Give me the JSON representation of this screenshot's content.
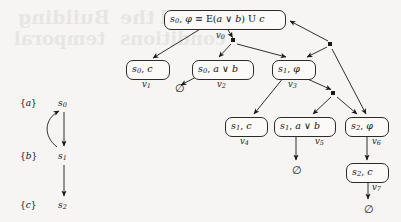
{
  "figure": {
    "kind": "tableau-graph-with-transition-system",
    "background_color": "#f6f5f3",
    "ink_color": "#1a1a1a",
    "node_fill": "#fbfaf8"
  },
  "transition_system": {
    "title": "",
    "states": [
      {
        "id": "s0",
        "state_label": "s",
        "state_sub": "0",
        "ap_label": "{a}",
        "x": 63,
        "y": 103,
        "ap_x": 20,
        "ap_y": 103
      },
      {
        "id": "s1",
        "state_label": "s",
        "state_sub": "1",
        "ap_label": "{b}",
        "x": 63,
        "y": 156,
        "ap_x": 20,
        "ap_y": 156
      },
      {
        "id": "s2",
        "state_label": "s",
        "state_sub": "2",
        "ap_label": "{c}",
        "x": 63,
        "y": 205,
        "ap_x": 20,
        "ap_y": 205
      }
    ],
    "transitions": [
      {
        "from": "s0",
        "to": "s1",
        "style": "straight-down"
      },
      {
        "from": "s1",
        "to": "s0",
        "style": "curved-back-up"
      },
      {
        "from": "s1",
        "to": "s2",
        "style": "straight-down"
      }
    ]
  },
  "tableau": {
    "nodes": [
      {
        "id": "v0",
        "text_parts": [
          {
            "t": "s",
            "style": "italic"
          },
          {
            "t": "0",
            "style": "sub"
          },
          {
            "t": ", ",
            "style": "upright"
          },
          {
            "t": "φ",
            "style": "italic"
          },
          {
            "t": " ≡ ",
            "style": "upright"
          },
          {
            "t": "E",
            "style": "upright"
          },
          {
            "t": "(",
            "style": "upright"
          },
          {
            "t": "a",
            "style": "italic"
          },
          {
            "t": " ∨ ",
            "style": "upright"
          },
          {
            "t": "b",
            "style": "italic"
          },
          {
            "t": ") ",
            "style": "upright"
          },
          {
            "t": "U",
            "style": "upright"
          },
          {
            "t": " ",
            "style": "upright"
          },
          {
            "t": "c",
            "style": "italic"
          }
        ],
        "plain": "s0, φ ≡ E(a ∨ b) U c",
        "vlabel": "v",
        "vsub": "0",
        "x": 164,
        "y": 10,
        "w": 122,
        "h": 17,
        "vlabel_x": 216,
        "vlabel_y": 30
      },
      {
        "id": "v1",
        "plain": "s0, c",
        "text_parts": [
          {
            "t": "s",
            "style": "italic"
          },
          {
            "t": "0",
            "style": "sub"
          },
          {
            "t": ", ",
            "style": "upright"
          },
          {
            "t": "c",
            "style": "italic"
          }
        ],
        "vlabel": "v",
        "vsub": "1",
        "x": 126,
        "y": 60,
        "w": 44,
        "h": 16,
        "vlabel_x": 142,
        "vlabel_y": 79
      },
      {
        "id": "v2",
        "plain": "s0, a ∨ b",
        "text_parts": [
          {
            "t": "s",
            "style": "italic"
          },
          {
            "t": "0",
            "style": "sub"
          },
          {
            "t": ", ",
            "style": "upright"
          },
          {
            "t": "a",
            "style": "italic"
          },
          {
            "t": " ∨ ",
            "style": "upright"
          },
          {
            "t": "b",
            "style": "italic"
          }
        ],
        "vlabel": "v",
        "vsub": "2",
        "x": 192,
        "y": 60,
        "w": 62,
        "h": 16,
        "vlabel_x": 217,
        "vlabel_y": 79
      },
      {
        "id": "v3",
        "plain": "s1, φ",
        "text_parts": [
          {
            "t": "s",
            "style": "italic"
          },
          {
            "t": "1",
            "style": "sub"
          },
          {
            "t": ", ",
            "style": "upright"
          },
          {
            "t": "φ",
            "style": "italic"
          }
        ],
        "vlabel": "v",
        "vsub": "3",
        "x": 272,
        "y": 60,
        "w": 44,
        "h": 16,
        "vlabel_x": 288,
        "vlabel_y": 79
      },
      {
        "id": "v4",
        "plain": "s1, c",
        "text_parts": [
          {
            "t": "s",
            "style": "italic"
          },
          {
            "t": "1",
            "style": "sub"
          },
          {
            "t": ", ",
            "style": "upright"
          },
          {
            "t": "c",
            "style": "italic"
          }
        ],
        "vlabel": "v",
        "vsub": "4",
        "x": 225,
        "y": 117,
        "w": 43,
        "h": 16,
        "vlabel_x": 240,
        "vlabel_y": 136
      },
      {
        "id": "v5",
        "plain": "s1, a ∨ b",
        "text_parts": [
          {
            "t": "s",
            "style": "italic"
          },
          {
            "t": "1",
            "style": "sub"
          },
          {
            "t": ", ",
            "style": "upright"
          },
          {
            "t": "a",
            "style": "italic"
          },
          {
            "t": " ∨ ",
            "style": "upright"
          },
          {
            "t": "b",
            "style": "italic"
          }
        ],
        "vlabel": "v",
        "vsub": "5",
        "x": 274,
        "y": 117,
        "w": 62,
        "h": 16,
        "vlabel_x": 315,
        "vlabel_y": 136
      },
      {
        "id": "v6",
        "plain": "s2, φ",
        "text_parts": [
          {
            "t": "s",
            "style": "italic"
          },
          {
            "t": "2",
            "style": "sub"
          },
          {
            "t": ", ",
            "style": "upright"
          },
          {
            "t": "φ",
            "style": "italic"
          }
        ],
        "vlabel": "v",
        "vsub": "6",
        "x": 345,
        "y": 117,
        "w": 44,
        "h": 16,
        "vlabel_x": 372,
        "vlabel_y": 136
      },
      {
        "id": "v7",
        "plain": "s2, c",
        "text_parts": [
          {
            "t": "s",
            "style": "italic"
          },
          {
            "t": "2",
            "style": "sub"
          },
          {
            "t": ", ",
            "style": "upright"
          },
          {
            "t": "c",
            "style": "italic"
          }
        ],
        "vlabel": "v",
        "vsub": "7",
        "x": 346,
        "y": 163,
        "w": 43,
        "h": 16,
        "vlabel_x": 372,
        "vlabel_y": 182
      }
    ],
    "junctions": [
      {
        "id": "j1",
        "x": 233,
        "y": 40
      },
      {
        "id": "j2",
        "x": 330,
        "y": 44
      },
      {
        "id": "j3",
        "x": 333,
        "y": 93
      }
    ],
    "empty_sets": [
      {
        "id": "e1",
        "glyph": "∅",
        "x": 175,
        "y": 82,
        "from": "v2"
      },
      {
        "id": "e2",
        "glyph": "∅",
        "x": 292,
        "y": 164,
        "from": "v5"
      },
      {
        "id": "e3",
        "glyph": "∅",
        "x": 364,
        "y": 203,
        "from": "v7"
      }
    ],
    "edges": [
      {
        "from": "v0",
        "to": "v1"
      },
      {
        "from": "v0",
        "to": "j1"
      },
      {
        "from": "j1",
        "to": "v2"
      },
      {
        "from": "j1",
        "to": "v3"
      },
      {
        "from": "j2",
        "to": "v0"
      },
      {
        "from": "j2",
        "to": "v3"
      },
      {
        "from": "j2",
        "to": "v6"
      },
      {
        "from": "v3",
        "to": "v4"
      },
      {
        "from": "v3",
        "to": "j3"
      },
      {
        "from": "j3",
        "to": "v5"
      },
      {
        "from": "j3",
        "to": "v6"
      },
      {
        "from": "v2",
        "to": "e1"
      },
      {
        "from": "v5",
        "to": "e2"
      },
      {
        "from": "v6",
        "to": "v7"
      },
      {
        "from": "v7",
        "to": "e3"
      }
    ]
  },
  "bleed_through": [
    {
      "text": "Building",
      "x": 18,
      "y": 6,
      "size": 19
    },
    {
      "text": "the",
      "x": 120,
      "y": 6,
      "size": 19
    },
    {
      "text": "Hybrid",
      "x": 160,
      "y": 6,
      "size": 19
    },
    {
      "text": "temporal",
      "x": 14,
      "y": 28,
      "size": 18
    },
    {
      "text": "conditions",
      "x": 120,
      "y": 28,
      "size": 18
    }
  ]
}
